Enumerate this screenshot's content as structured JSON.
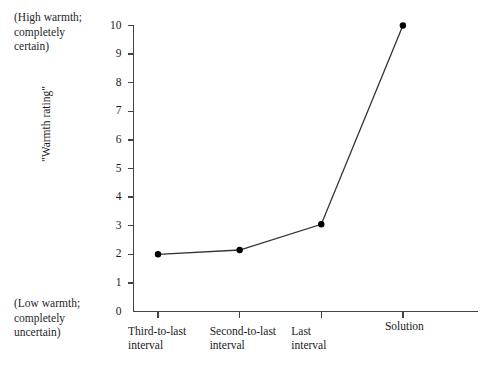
{
  "chart_data": {
    "type": "line",
    "title": "",
    "xlabel": "",
    "ylabel": "\"Warmth rating\"",
    "categories": [
      "Third-to-last\ninterval",
      "Second-to-last\ninterval",
      "Last\ninterval",
      "Solution"
    ],
    "values": [
      2.0,
      2.15,
      3.05,
      10.0
    ],
    "series": [
      {
        "name": "Warmth rating",
        "values": [
          2.0,
          2.15,
          3.05,
          10.0
        ]
      }
    ],
    "ylim": [
      0,
      10
    ],
    "yticks": [
      0,
      1,
      2,
      3,
      4,
      5,
      6,
      7,
      8,
      9,
      10
    ],
    "ytick_labels": [
      "0",
      "1",
      "2",
      "3",
      "4",
      "5",
      "6",
      "7",
      "8",
      "9",
      "10"
    ],
    "grid": false,
    "legend": "none",
    "line_color": "#333333",
    "marker_color": "#000000",
    "axis_color": "#444444",
    "background_color": "#ffffff"
  },
  "annotations": {
    "high_anchor": "(High warmth;\ncompletely\ncertain)",
    "low_anchor": "(Low warmth;\ncompletely\nuncertain)"
  }
}
